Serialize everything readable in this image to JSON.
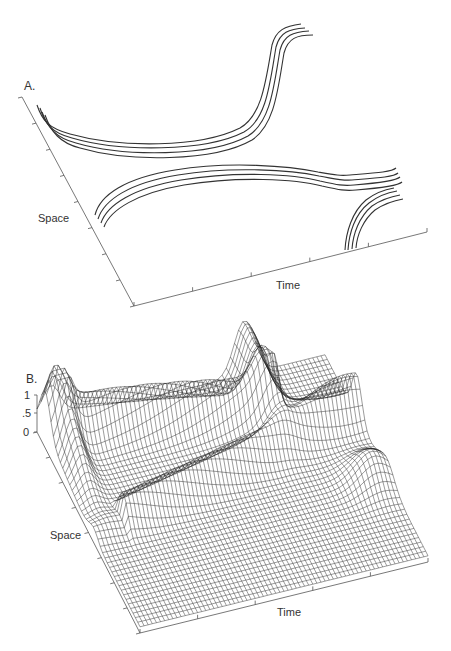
{
  "figure": {
    "panel_a": {
      "label": "A.",
      "x_axis_label": "Time",
      "y_axis_label": "Space",
      "description": "Contour lines of traveling waves in space-time: three bundles of four parallel curves"
    },
    "panel_b": {
      "label": "B.",
      "x_axis_label": "Time",
      "y_axis_label": "Space",
      "z_ticks": [
        "1",
        ".5",
        "0"
      ],
      "description": "3D wireframe mesh surface of activity (0 to 1) over space and time"
    }
  },
  "chart_data": [
    {
      "type": "line",
      "title": "A.",
      "xlabel": "Time",
      "ylabel": "Space",
      "grid": false,
      "series": [
        {
          "name": "wave-front-1 (upper curve bundle)",
          "lines": 4
        },
        {
          "name": "wave-front-2 (middle curve bundle)",
          "lines": 4
        },
        {
          "name": "wave-front-3 (lower-right arc bundle)",
          "lines": 4
        }
      ]
    },
    {
      "type": "surface",
      "title": "B.",
      "xlabel": "Time",
      "ylabel": "Space",
      "zlabel": "",
      "zlim": [
        0,
        1
      ],
      "z_ticks": [
        0,
        0.5,
        1
      ],
      "grid": false
    }
  ]
}
